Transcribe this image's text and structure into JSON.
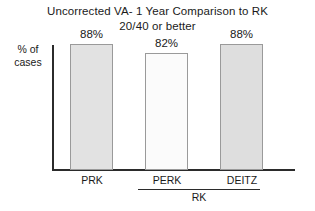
{
  "chart_data": {
    "type": "bar",
    "title": "Uncorrected VA- 1 Year Comparison to RK",
    "subtitle": "20/40 or better",
    "title_lines": [
      "Uncorrected VA- 1 Year Comparison to RK",
      "20/40 or better"
    ],
    "categories": [
      "PRK",
      "PERK",
      "DEITZ"
    ],
    "values": [
      88,
      82,
      88
    ],
    "value_labels": [
      "88%",
      "82%",
      "88%"
    ],
    "xlabel": "",
    "ylabel": "% of cases",
    "ylabel_lines": [
      "% of",
      "cases"
    ],
    "ylim": [
      0,
      100
    ],
    "grid": false,
    "legend": "none",
    "group_bracket": {
      "label": "RK",
      "members": [
        "PERK",
        "DEITZ"
      ]
    },
    "bar_colors": [
      "#e2e2e2",
      "#fbfbfb",
      "#dedede"
    ],
    "bar_border_color": "#9a9a9a",
    "axis_color": "#2b2b2b",
    "background": "#ffffff"
  }
}
